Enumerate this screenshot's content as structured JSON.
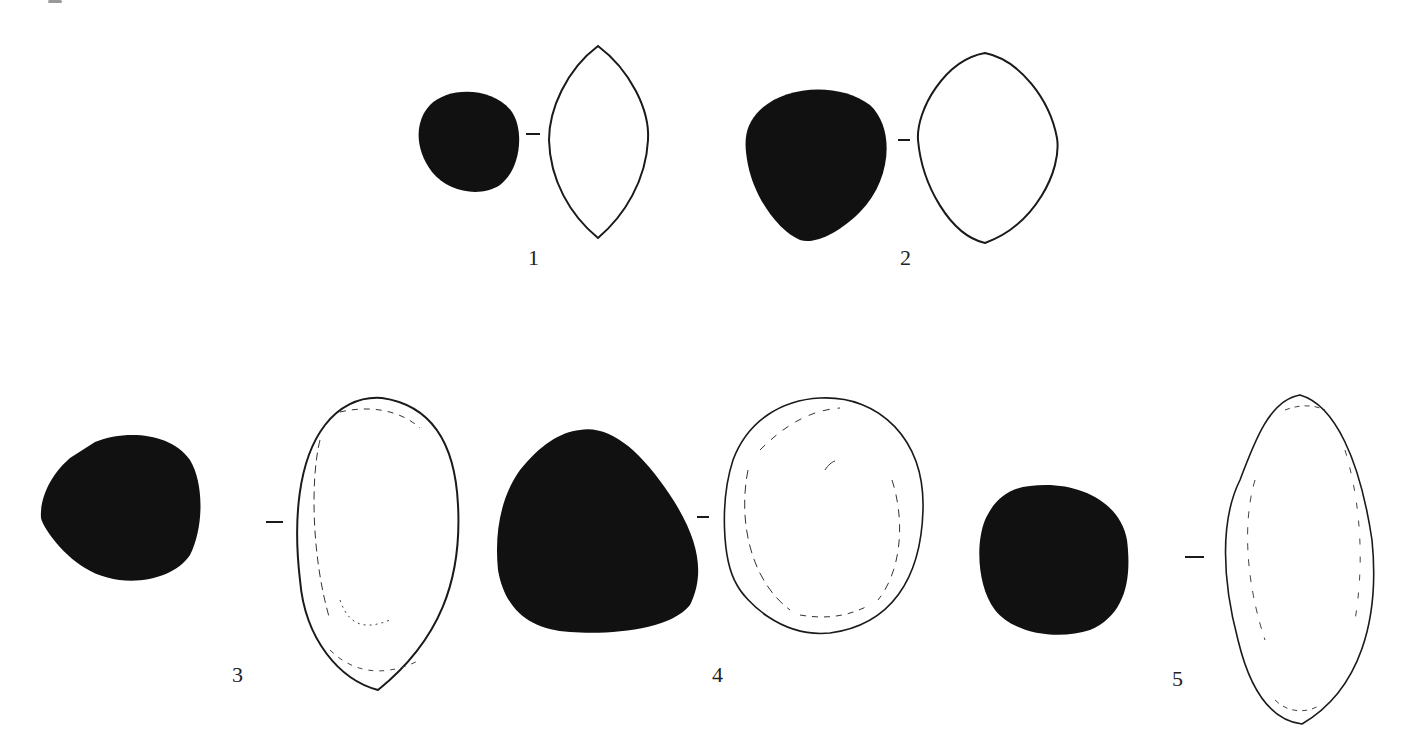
{
  "figure": {
    "items": [
      {
        "number": "1",
        "label_pos": [
          528,
          245
        ],
        "view": "section-lenticular"
      },
      {
        "number": "2",
        "label_pos": [
          900,
          245
        ],
        "view": "section-oval"
      },
      {
        "number": "3",
        "label_pos": [
          232,
          662
        ],
        "view": "plan-ovoid"
      },
      {
        "number": "4",
        "label_pos": [
          712,
          662
        ],
        "view": "plan-rounded"
      },
      {
        "number": "5",
        "label_pos": [
          1172,
          666
        ],
        "view": "plan-elongated"
      }
    ],
    "colors": {
      "fill": "#111111",
      "stroke": "#1a1a1a",
      "background": "#ffffff"
    }
  }
}
